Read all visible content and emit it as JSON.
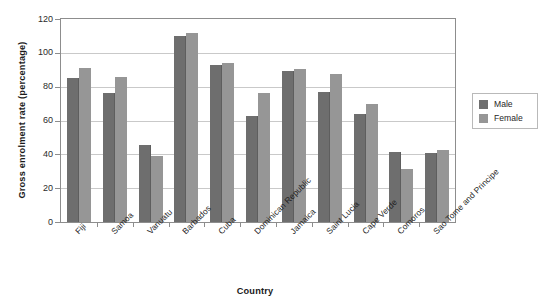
{
  "chart_data": {
    "type": "bar",
    "title": "",
    "xlabel": "Country",
    "ylabel": "Gross enrolment rate (percentage)",
    "ylim": [
      0,
      120
    ],
    "ytick_labels": [
      "120",
      "100",
      "80",
      "60",
      "40",
      "20",
      "0"
    ],
    "ytick_values": [
      120,
      100,
      80,
      60,
      40,
      20,
      0
    ],
    "grid": true,
    "legend_position": "right",
    "categories": [
      "Fiji",
      "Samoa",
      "Vanuatu",
      "Barbados",
      "Cuba",
      "Dominican Republic",
      "Jamaica",
      "Saint Lucia",
      "Cape Verde",
      "Comoros",
      "Sao Tome and Principe"
    ],
    "series": [
      {
        "name": "Male",
        "color": "#6e6e6e",
        "values": [
          85,
          76.5,
          45.5,
          110,
          93,
          62.5,
          89,
          77,
          64,
          41.5,
          41
        ]
      },
      {
        "name": "Female",
        "color": "#969696",
        "values": [
          91,
          86,
          39,
          111.5,
          94,
          76.5,
          90.5,
          87.5,
          70,
          31.5,
          42.5
        ]
      }
    ]
  },
  "legend": {
    "items": [
      {
        "label": "Male",
        "color": "#6e6e6e"
      },
      {
        "label": "Female",
        "color": "#969696"
      }
    ]
  },
  "colors": {
    "male": "#6e6e6e",
    "female": "#969696",
    "grid": "#c9c9c9",
    "axis": "#8d8d8d",
    "text": "#1a1a1a",
    "background": "#ffffff"
  }
}
